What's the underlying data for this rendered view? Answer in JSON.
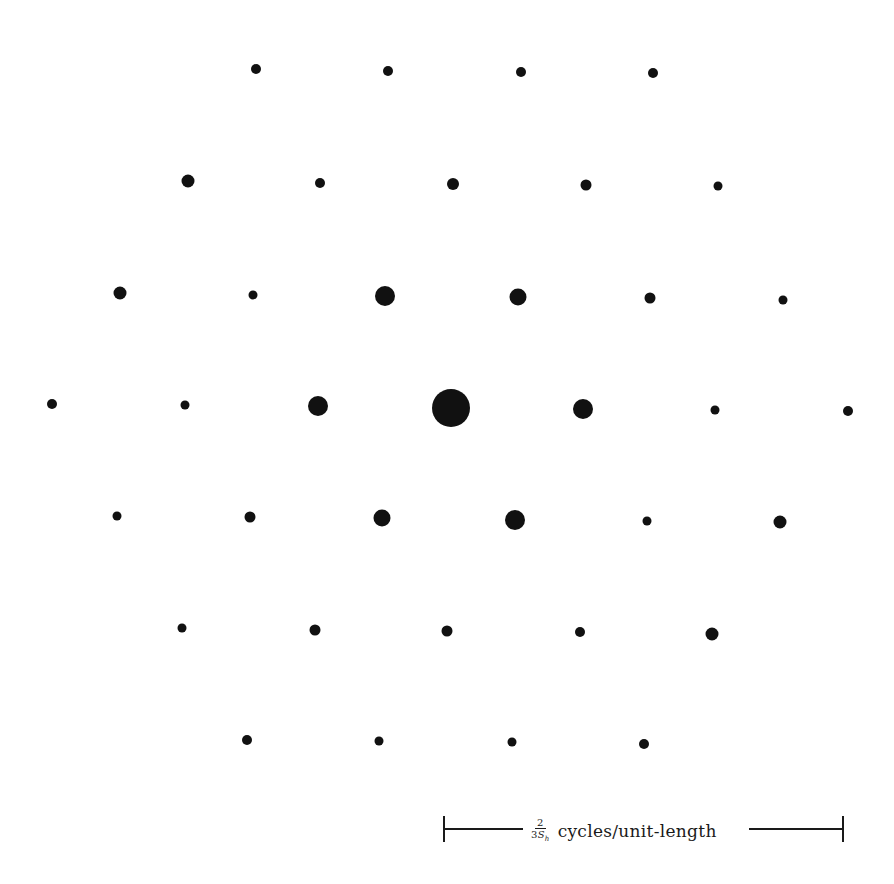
{
  "figure": {
    "dot_color": "#111111",
    "background": "#ffffff"
  },
  "dots": [
    {
      "x": 256,
      "y": 69,
      "r": 5
    },
    {
      "x": 388,
      "y": 71,
      "r": 5
    },
    {
      "x": 521,
      "y": 72,
      "r": 5
    },
    {
      "x": 653,
      "y": 73,
      "r": 5
    },
    {
      "x": 188,
      "y": 181,
      "r": 6.5
    },
    {
      "x": 320,
      "y": 183,
      "r": 5
    },
    {
      "x": 453,
      "y": 184,
      "r": 6
    },
    {
      "x": 586,
      "y": 185,
      "r": 5.5
    },
    {
      "x": 718,
      "y": 186,
      "r": 4.5
    },
    {
      "x": 120,
      "y": 293,
      "r": 6.5
    },
    {
      "x": 253,
      "y": 295,
      "r": 4.5
    },
    {
      "x": 385,
      "y": 296,
      "r": 10
    },
    {
      "x": 518,
      "y": 297,
      "r": 8.5
    },
    {
      "x": 650,
      "y": 298,
      "r": 5.5
    },
    {
      "x": 783,
      "y": 300,
      "r": 4.5
    },
    {
      "x": 52,
      "y": 404,
      "r": 5
    },
    {
      "x": 185,
      "y": 405,
      "r": 4.5
    },
    {
      "x": 318,
      "y": 406,
      "r": 10
    },
    {
      "x": 451,
      "y": 408,
      "r": 19
    },
    {
      "x": 583,
      "y": 409,
      "r": 10
    },
    {
      "x": 715,
      "y": 410,
      "r": 4.5
    },
    {
      "x": 848,
      "y": 411,
      "r": 5
    },
    {
      "x": 117,
      "y": 516,
      "r": 4.5
    },
    {
      "x": 250,
      "y": 517,
      "r": 5.5
    },
    {
      "x": 382,
      "y": 518,
      "r": 8.5
    },
    {
      "x": 515,
      "y": 520,
      "r": 10
    },
    {
      "x": 647,
      "y": 521,
      "r": 4.5
    },
    {
      "x": 780,
      "y": 522,
      "r": 6.5
    },
    {
      "x": 182,
      "y": 628,
      "r": 4.5
    },
    {
      "x": 315,
      "y": 630,
      "r": 5.5
    },
    {
      "x": 447,
      "y": 631,
      "r": 5.5
    },
    {
      "x": 580,
      "y": 632,
      "r": 5
    },
    {
      "x": 712,
      "y": 634,
      "r": 6.5
    },
    {
      "x": 247,
      "y": 740,
      "r": 5
    },
    {
      "x": 379,
      "y": 741,
      "r": 4.5
    },
    {
      "x": 512,
      "y": 742,
      "r": 4.5
    },
    {
      "x": 644,
      "y": 744,
      "r": 5
    }
  ],
  "scale_bar": {
    "numerator": "2",
    "denominator_prefix": "3",
    "denominator_symbol": "S",
    "denominator_subscript": "h",
    "unit_text": "cycles/unit-length"
  }
}
